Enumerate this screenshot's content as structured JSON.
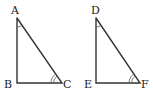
{
  "figure": {
    "triangles": [
      {
        "id": "ABC",
        "vertices": {
          "A": {
            "label": "A"
          },
          "B": {
            "label": "B"
          },
          "C": {
            "label": "C"
          }
        },
        "right_angle_at": "B",
        "angle_marks": [
          {
            "vertex": "A",
            "arcs": 1
          },
          {
            "vertex": "C",
            "arcs": 2
          }
        ]
      },
      {
        "id": "DEF",
        "vertices": {
          "D": {
            "label": "D"
          },
          "E": {
            "label": "E"
          },
          "F": {
            "label": "F"
          }
        },
        "right_angle_at": "E",
        "angle_marks": [
          {
            "vertex": "D",
            "arcs": 1
          },
          {
            "vertex": "F",
            "arcs": 2
          }
        ]
      }
    ],
    "colors": {
      "stroke": "#333333",
      "background": "#ffffff"
    }
  }
}
